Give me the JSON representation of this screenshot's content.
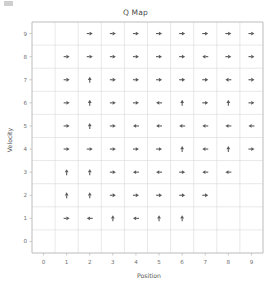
{
  "chart_data": {
    "type": "scatter",
    "title": "Q Map",
    "xlabel": "Position",
    "ylabel": "Velocity",
    "xlim": [
      -0.5,
      9.5
    ],
    "ylim": [
      -0.5,
      9.5
    ],
    "x_ticks": [
      "0",
      "1",
      "2",
      "3",
      "4",
      "5",
      "6",
      "7",
      "8",
      "9"
    ],
    "y_ticks": [
      "0",
      "1",
      "2",
      "3",
      "4",
      "5",
      "6",
      "7",
      "8",
      "9"
    ],
    "grid": true,
    "legend": "none",
    "marker_style": "arrow",
    "arrow_color": "#5a5a5a",
    "grid_color": "#d9d9d9",
    "axis_color": "#bcbcbc",
    "arrows": [
      {
        "x": 2,
        "y": 9,
        "dir": "right"
      },
      {
        "x": 3,
        "y": 9,
        "dir": "right"
      },
      {
        "x": 4,
        "y": 9,
        "dir": "right"
      },
      {
        "x": 5,
        "y": 9,
        "dir": "right"
      },
      {
        "x": 6,
        "y": 9,
        "dir": "right"
      },
      {
        "x": 7,
        "y": 9,
        "dir": "right"
      },
      {
        "x": 8,
        "y": 9,
        "dir": "right"
      },
      {
        "x": 9,
        "y": 9,
        "dir": "right"
      },
      {
        "x": 1,
        "y": 8,
        "dir": "right"
      },
      {
        "x": 2,
        "y": 8,
        "dir": "right"
      },
      {
        "x": 3,
        "y": 8,
        "dir": "right"
      },
      {
        "x": 4,
        "y": 8,
        "dir": "right"
      },
      {
        "x": 5,
        "y": 8,
        "dir": "right"
      },
      {
        "x": 6,
        "y": 8,
        "dir": "right"
      },
      {
        "x": 7,
        "y": 8,
        "dir": "left"
      },
      {
        "x": 8,
        "y": 8,
        "dir": "right"
      },
      {
        "x": 9,
        "y": 8,
        "dir": "right"
      },
      {
        "x": 1,
        "y": 7,
        "dir": "right"
      },
      {
        "x": 2,
        "y": 7,
        "dir": "up"
      },
      {
        "x": 3,
        "y": 7,
        "dir": "right"
      },
      {
        "x": 4,
        "y": 7,
        "dir": "right"
      },
      {
        "x": 5,
        "y": 7,
        "dir": "right"
      },
      {
        "x": 6,
        "y": 7,
        "dir": "right"
      },
      {
        "x": 7,
        "y": 7,
        "dir": "right"
      },
      {
        "x": 8,
        "y": 7,
        "dir": "left"
      },
      {
        "x": 9,
        "y": 7,
        "dir": "right"
      },
      {
        "x": 1,
        "y": 6,
        "dir": "right"
      },
      {
        "x": 2,
        "y": 6,
        "dir": "up"
      },
      {
        "x": 3,
        "y": 6,
        "dir": "right"
      },
      {
        "x": 4,
        "y": 6,
        "dir": "right"
      },
      {
        "x": 5,
        "y": 6,
        "dir": "left"
      },
      {
        "x": 6,
        "y": 6,
        "dir": "up"
      },
      {
        "x": 7,
        "y": 6,
        "dir": "right"
      },
      {
        "x": 8,
        "y": 6,
        "dir": "up"
      },
      {
        "x": 9,
        "y": 6,
        "dir": "right"
      },
      {
        "x": 1,
        "y": 5,
        "dir": "right"
      },
      {
        "x": 2,
        "y": 5,
        "dir": "up"
      },
      {
        "x": 3,
        "y": 5,
        "dir": "right"
      },
      {
        "x": 4,
        "y": 5,
        "dir": "left"
      },
      {
        "x": 5,
        "y": 5,
        "dir": "left"
      },
      {
        "x": 6,
        "y": 5,
        "dir": "left"
      },
      {
        "x": 7,
        "y": 5,
        "dir": "left"
      },
      {
        "x": 8,
        "y": 5,
        "dir": "left"
      },
      {
        "x": 9,
        "y": 5,
        "dir": "left"
      },
      {
        "x": 1,
        "y": 4,
        "dir": "right"
      },
      {
        "x": 2,
        "y": 4,
        "dir": "right"
      },
      {
        "x": 3,
        "y": 4,
        "dir": "right"
      },
      {
        "x": 4,
        "y": 4,
        "dir": "right"
      },
      {
        "x": 5,
        "y": 4,
        "dir": "right"
      },
      {
        "x": 6,
        "y": 4,
        "dir": "up"
      },
      {
        "x": 7,
        "y": 4,
        "dir": "left"
      },
      {
        "x": 8,
        "y": 4,
        "dir": "up"
      },
      {
        "x": 9,
        "y": 4,
        "dir": "right"
      },
      {
        "x": 1,
        "y": 3,
        "dir": "up"
      },
      {
        "x": 2,
        "y": 3,
        "dir": "up"
      },
      {
        "x": 3,
        "y": 3,
        "dir": "right"
      },
      {
        "x": 4,
        "y": 3,
        "dir": "left"
      },
      {
        "x": 5,
        "y": 3,
        "dir": "left"
      },
      {
        "x": 6,
        "y": 3,
        "dir": "right"
      },
      {
        "x": 7,
        "y": 3,
        "dir": "left"
      },
      {
        "x": 8,
        "y": 3,
        "dir": "left"
      },
      {
        "x": 1,
        "y": 2,
        "dir": "up"
      },
      {
        "x": 2,
        "y": 2,
        "dir": "up"
      },
      {
        "x": 3,
        "y": 2,
        "dir": "right"
      },
      {
        "x": 4,
        "y": 2,
        "dir": "right"
      },
      {
        "x": 5,
        "y": 2,
        "dir": "right"
      },
      {
        "x": 6,
        "y": 2,
        "dir": "right"
      },
      {
        "x": 7,
        "y": 2,
        "dir": "right"
      },
      {
        "x": 1,
        "y": 1,
        "dir": "right"
      },
      {
        "x": 2,
        "y": 1,
        "dir": "left"
      },
      {
        "x": 3,
        "y": 1,
        "dir": "up"
      },
      {
        "x": 4,
        "y": 1,
        "dir": "left"
      },
      {
        "x": 5,
        "y": 1,
        "dir": "up"
      },
      {
        "x": 6,
        "y": 1,
        "dir": "up"
      }
    ]
  }
}
